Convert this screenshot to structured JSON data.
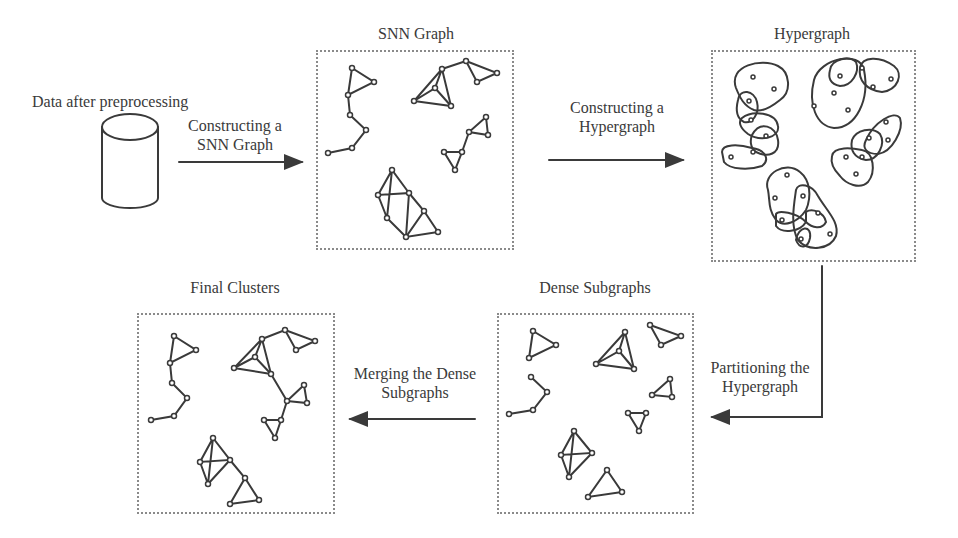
{
  "stages": {
    "input": {
      "label": "Data after preprocessing",
      "icon": "database-cylinder-icon"
    },
    "snn_graph": {
      "label": "SNN Graph"
    },
    "hypergraph": {
      "label": "Hypergraph"
    },
    "dense_subgraphs": {
      "label": "Dense Subgraphs"
    },
    "final_clusters": {
      "label": "Final Clusters"
    }
  },
  "steps": {
    "construct_snn": {
      "line1": "Constructing a",
      "line2": "SNN Graph"
    },
    "construct_hypergraph": {
      "line1": "Constructing a",
      "line2": "Hypergraph"
    },
    "partition": {
      "line1": "Partitioning the",
      "line2": "Hypergraph"
    },
    "merge": {
      "line1": "Merging the Dense",
      "line2": "Subgraphs"
    }
  },
  "colors": {
    "ink": "#3a3a3a",
    "panel_border": "#8a8a8a",
    "background": "#ffffff"
  }
}
